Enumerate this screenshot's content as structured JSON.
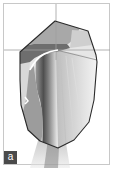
{
  "figure": {
    "panel_label": "a",
    "colors": {
      "frame_border": "#c8c8c8",
      "outline": "#2a2a2a",
      "crosshair": "#a0a0a0",
      "dark_region": "#555555",
      "mid_region": "#8c8c8c",
      "light_region": "#d0d0d0",
      "highlight_curve": "#ffffff",
      "label_bg": "#4a4a4a",
      "label_text": "#ffffff"
    },
    "crosshair": {
      "vertical_x": 56,
      "horizontal_y": 50
    }
  }
}
